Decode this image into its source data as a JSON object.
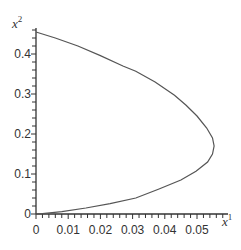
{
  "chart_data": {
    "type": "line",
    "title": "",
    "xlabel": "x",
    "xlabel_superscript": "1",
    "ylabel": "x",
    "ylabel_superscript": "2",
    "xlim": [
      0,
      0.059
    ],
    "ylim": [
      0,
      0.465
    ],
    "grid": false,
    "legend": null,
    "x_ticks": [
      "0",
      "0.01",
      "0.02",
      "0.03",
      "0.04",
      "0.05"
    ],
    "y_ticks": [
      "0",
      "0.1",
      "0.2",
      "0.3",
      "0.4"
    ],
    "series": [
      {
        "name": "trajectory",
        "color": "#555555",
        "points": [
          [
            0.0,
            0.455
          ],
          [
            0.006,
            0.44
          ],
          [
            0.013,
            0.42
          ],
          [
            0.02,
            0.396
          ],
          [
            0.027,
            0.37
          ],
          [
            0.031,
            0.357
          ],
          [
            0.037,
            0.33
          ],
          [
            0.043,
            0.297
          ],
          [
            0.0466,
            0.272
          ],
          [
            0.05,
            0.245
          ],
          [
            0.053,
            0.215
          ],
          [
            0.0548,
            0.19
          ],
          [
            0.0553,
            0.17
          ],
          [
            0.0548,
            0.15
          ],
          [
            0.0533,
            0.13
          ],
          [
            0.0497,
            0.107
          ],
          [
            0.045,
            0.085
          ],
          [
            0.038,
            0.062
          ],
          [
            0.031,
            0.04
          ],
          [
            0.023,
            0.026
          ],
          [
            0.0155,
            0.015
          ],
          [
            0.008,
            0.006
          ],
          [
            0.002,
            0.001
          ],
          [
            0.0,
            0.0
          ]
        ]
      }
    ]
  },
  "layout": {
    "origin_px": [
      36,
      214
    ],
    "x_px_per_unit": 3220,
    "y_px_per_unit": 400,
    "x_axis_end_px": 228,
    "y_axis_top_px": 28,
    "x_minor_step": 0.002,
    "y_minor_step": 0.02,
    "axis_color": "#333333",
    "curve_color": "#555555"
  }
}
